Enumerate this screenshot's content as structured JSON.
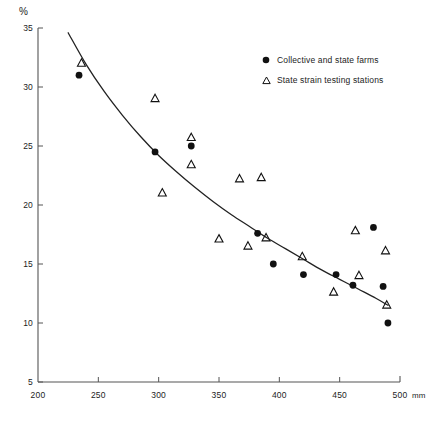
{
  "chart_data": {
    "type": "scatter",
    "title": "",
    "xlabel": "mm",
    "ylabel": "%",
    "xlim": [
      200,
      500
    ],
    "ylim": [
      5,
      35
    ],
    "grid": false,
    "legend_position": "top-right",
    "x_ticks": [
      200,
      250,
      300,
      350,
      400,
      450,
      500
    ],
    "y_ticks": [
      5,
      10,
      15,
      20,
      25,
      30,
      35
    ],
    "x_unit": "mm",
    "y_unit": "%",
    "legend": [
      {
        "marker": "filled-circle",
        "label": "Collective and state farms"
      },
      {
        "marker": "open-triangle",
        "label": "State strain testing stations"
      }
    ],
    "series": [
      {
        "name": "Collective and state farms",
        "marker": "filled-circle",
        "points": [
          [
            234,
            31.0
          ],
          [
            297,
            24.5
          ],
          [
            327,
            25.0
          ],
          [
            382,
            17.6
          ],
          [
            395,
            15.0
          ],
          [
            420,
            14.1
          ],
          [
            447,
            14.1
          ],
          [
            461,
            13.2
          ],
          [
            478,
            18.1
          ],
          [
            486,
            13.1
          ],
          [
            490,
            10.0
          ]
        ]
      },
      {
        "name": "State strain testing stations",
        "marker": "open-triangle",
        "points": [
          [
            236,
            32.0
          ],
          [
            297,
            29.0
          ],
          [
            303,
            21.0
          ],
          [
            327,
            25.7
          ],
          [
            327,
            23.4
          ],
          [
            350,
            17.1
          ],
          [
            367,
            22.2
          ],
          [
            374,
            16.5
          ],
          [
            385,
            22.3
          ],
          [
            389,
            17.2
          ],
          [
            419,
            15.6
          ],
          [
            445,
            12.6
          ],
          [
            463,
            17.8
          ],
          [
            466,
            14.0
          ],
          [
            488,
            16.1
          ],
          [
            489,
            11.5
          ]
        ]
      }
    ],
    "trend_curve": {
      "name": "fitted trend",
      "points": [
        [
          225,
          34.6
        ],
        [
          240,
          31.9
        ],
        [
          255,
          29.6
        ],
        [
          270,
          27.6
        ],
        [
          285,
          25.8
        ],
        [
          300,
          24.2
        ],
        [
          315,
          22.8
        ],
        [
          330,
          21.5
        ],
        [
          345,
          20.3
        ],
        [
          360,
          19.2
        ],
        [
          375,
          18.2
        ],
        [
          390,
          17.2
        ],
        [
          405,
          16.3
        ],
        [
          420,
          15.4
        ],
        [
          435,
          14.5
        ],
        [
          450,
          13.7
        ],
        [
          465,
          12.9
        ],
        [
          480,
          12.1
        ],
        [
          490,
          11.5
        ]
      ]
    },
    "style": {
      "axis_color": "#555555",
      "curve_color": "#222222",
      "marker_color": "#111111",
      "background": "#ffffff"
    }
  }
}
